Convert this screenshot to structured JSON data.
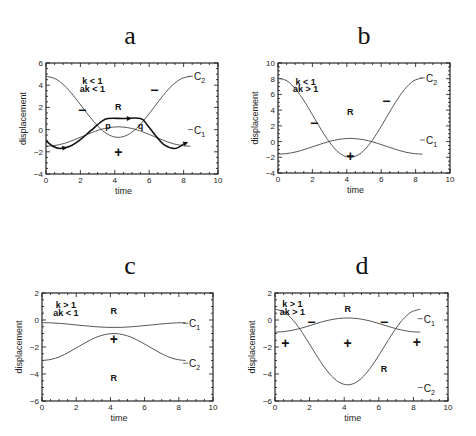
{
  "chart_data": [
    {
      "panel": "a",
      "type": "line",
      "title": "a",
      "xlabel": "time",
      "ylabel": "displacement",
      "xlim": [
        0,
        10
      ],
      "ylim": [
        -4,
        6
      ],
      "xticks": [
        0,
        2,
        4,
        6,
        8,
        10
      ],
      "yticks": [
        -4,
        -2,
        0,
        2,
        4,
        6
      ],
      "grid": false,
      "annotations": [
        {
          "text": "k < 1",
          "x": 2.7,
          "y": 4.4
        },
        {
          "text": "ak < 1",
          "x": 2.7,
          "y": 3.7
        },
        {
          "text": "R",
          "x": 4.2,
          "y": 2.0
        },
        {
          "text": "p",
          "x": 3.6,
          "y": 0.35
        },
        {
          "text": "q",
          "x": 5.5,
          "y": 0.35
        },
        {
          "text": "−",
          "x": 2.1,
          "y": 1.7
        },
        {
          "text": "−",
          "x": 6.3,
          "y": 3.5
        },
        {
          "text": "+",
          "x": 4.2,
          "y": -2.1
        }
      ],
      "series": [
        {
          "name": "C2",
          "label": "C₂",
          "style": "thin",
          "x": [
            0,
            0.525,
            1.05,
            1.575,
            2.1,
            2.625,
            3.15,
            3.675,
            4.2,
            4.725,
            5.25,
            5.775,
            6.3,
            6.825,
            7.35,
            7.875,
            8.4
          ],
          "values": [
            4.8,
            4.59,
            4.0,
            3.1,
            2.05,
            1.0,
            0.1,
            -0.49,
            -0.7,
            -0.49,
            0.1,
            1.0,
            2.05,
            3.1,
            4.0,
            4.59,
            4.8
          ]
        },
        {
          "name": "C1",
          "label": "C₁",
          "style": "thin",
          "x": [
            0,
            0.525,
            1.05,
            1.575,
            2.1,
            2.625,
            3.15,
            3.675,
            4.2,
            4.725,
            5.25,
            5.775,
            6.3,
            6.825,
            7.35,
            7.875,
            8.4
          ],
          "values": [
            -1.5,
            -1.43,
            -1.25,
            -0.96,
            -0.63,
            -0.29,
            -0.0,
            0.18,
            0.25,
            0.18,
            0.0,
            -0.29,
            -0.63,
            -0.96,
            -1.25,
            -1.43,
            -1.5
          ]
        },
        {
          "name": "trajectory",
          "label": "",
          "style": "thick-arrow",
          "x": [
            0,
            0.4,
            0.8,
            1.4,
            2.0,
            2.6,
            3.2,
            3.6,
            4.5,
            5.5,
            5.9,
            6.4,
            6.9,
            7.5,
            8.0
          ],
          "values": [
            -1.0,
            -1.5,
            -1.7,
            -1.5,
            -0.9,
            -0.1,
            0.7,
            1.0,
            1.0,
            1.0,
            0.4,
            -0.6,
            -1.4,
            -1.7,
            -1.3
          ]
        }
      ],
      "curve_labels": [
        {
          "text": "C₂",
          "x": 8.6,
          "y": 4.8
        },
        {
          "text": "C₁",
          "x": 8.6,
          "y": 0.0
        }
      ]
    },
    {
      "panel": "b",
      "type": "line",
      "title": "b",
      "xlabel": "time",
      "ylabel": "displacement",
      "xlim": [
        0,
        10
      ],
      "ylim": [
        -4,
        10
      ],
      "xticks": [
        0,
        2,
        4,
        6,
        8,
        10
      ],
      "yticks": [
        -4,
        -2,
        0,
        2,
        4,
        6,
        8,
        10
      ],
      "grid": false,
      "annotations": [
        {
          "text": "k < 1",
          "x": 1.6,
          "y": 7.6
        },
        {
          "text": "ak > 1",
          "x": 1.6,
          "y": 6.7
        },
        {
          "text": "R",
          "x": 4.2,
          "y": 3.8
        },
        {
          "text": "−",
          "x": 2.1,
          "y": 2.2
        },
        {
          "text": "−",
          "x": 6.3,
          "y": 5.0
        },
        {
          "text": "+",
          "x": 4.2,
          "y": -2.0
        }
      ],
      "series": [
        {
          "name": "C2",
          "label": "C₂",
          "style": "thin",
          "x": [
            0,
            0.525,
            1.05,
            1.575,
            2.1,
            2.625,
            3.15,
            3.675,
            4.2,
            4.725,
            5.25,
            5.775,
            6.3,
            6.825,
            7.35,
            7.875,
            8.4
          ],
          "values": [
            8.1,
            7.72,
            6.62,
            4.98,
            3.05,
            1.12,
            -0.52,
            -1.62,
            -2.0,
            -1.62,
            -0.52,
            1.12,
            3.05,
            4.98,
            6.62,
            7.72,
            8.1
          ]
        },
        {
          "name": "C1",
          "label": "C₁",
          "style": "thin",
          "x": [
            0,
            0.525,
            1.05,
            1.575,
            2.1,
            2.625,
            3.15,
            3.675,
            4.2,
            4.725,
            5.25,
            5.775,
            6.3,
            6.825,
            7.35,
            7.875,
            8.4
          ],
          "values": [
            -1.6,
            -1.52,
            -1.31,
            -0.98,
            -0.6,
            -0.22,
            0.11,
            0.32,
            0.4,
            0.32,
            0.11,
            -0.22,
            -0.6,
            -0.98,
            -1.31,
            -1.52,
            -1.6
          ]
        }
      ],
      "curve_labels": [
        {
          "text": "C₂",
          "x": 8.6,
          "y": 8.1
        },
        {
          "text": "C₁",
          "x": 8.6,
          "y": 0.2
        }
      ]
    },
    {
      "panel": "c",
      "type": "line",
      "title": "c",
      "xlabel": "time",
      "ylabel": "displacement",
      "xlim": [
        0,
        10
      ],
      "ylim": [
        -6,
        2
      ],
      "xticks": [
        0,
        2,
        4,
        6,
        8,
        10
      ],
      "yticks": [
        -6,
        -4,
        -2,
        0,
        2
      ],
      "grid": false,
      "annotations": [
        {
          "text": "k > 1",
          "x": 1.4,
          "y": 1.1
        },
        {
          "text": "ak < 1",
          "x": 1.4,
          "y": 0.5
        },
        {
          "text": "R",
          "x": 4.2,
          "y": 0.7
        },
        {
          "text": "+",
          "x": 4.2,
          "y": -1.5
        },
        {
          "text": "R",
          "x": 4.2,
          "y": -4.3
        }
      ],
      "series": [
        {
          "name": "C1",
          "label": "C₁",
          "style": "thin",
          "x": [
            0,
            0.525,
            1.05,
            1.575,
            2.1,
            2.625,
            3.15,
            3.675,
            4.2,
            4.725,
            5.25,
            5.775,
            6.3,
            6.825,
            7.35,
            7.875,
            8.4
          ],
          "values": [
            -0.2,
            -0.21,
            -0.25,
            -0.31,
            -0.38,
            -0.44,
            -0.5,
            -0.54,
            -0.55,
            -0.54,
            -0.5,
            -0.44,
            -0.38,
            -0.31,
            -0.25,
            -0.21,
            -0.2
          ]
        },
        {
          "name": "C2",
          "label": "C₂",
          "style": "thin",
          "x": [
            0,
            0.525,
            1.05,
            1.575,
            2.1,
            2.625,
            3.15,
            3.675,
            4.2,
            4.725,
            5.25,
            5.775,
            6.3,
            6.825,
            7.35,
            7.875,
            8.4
          ],
          "values": [
            -3.0,
            -2.92,
            -2.71,
            -2.38,
            -2.0,
            -1.62,
            -1.29,
            -1.08,
            -1.0,
            -1.08,
            -1.29,
            -1.62,
            -2.0,
            -2.38,
            -2.71,
            -2.92,
            -3.0
          ]
        }
      ],
      "curve_labels": [
        {
          "text": "C₁",
          "x": 8.6,
          "y": -0.25
        },
        {
          "text": "C₂",
          "x": 8.6,
          "y": -3.2
        }
      ]
    },
    {
      "panel": "d",
      "type": "line",
      "title": "d",
      "xlabel": "time",
      "ylabel": "displacement",
      "xlim": [
        0,
        10
      ],
      "ylim": [
        -6,
        2
      ],
      "xticks": [
        0,
        2,
        4,
        6,
        8,
        10
      ],
      "yticks": [
        -6,
        -4,
        -2,
        0,
        2
      ],
      "grid": false,
      "annotations": [
        {
          "text": "k > 1",
          "x": 1.0,
          "y": 1.2
        },
        {
          "text": "ak > 1",
          "x": 1.0,
          "y": 0.6
        },
        {
          "text": "R",
          "x": 4.2,
          "y": 0.8
        },
        {
          "text": "−",
          "x": 2.1,
          "y": -0.2
        },
        {
          "text": "−",
          "x": 6.3,
          "y": -0.2
        },
        {
          "text": "+",
          "x": 0.6,
          "y": -1.8
        },
        {
          "text": "+",
          "x": 4.2,
          "y": -1.8
        },
        {
          "text": "+",
          "x": 8.2,
          "y": -1.7
        },
        {
          "text": "R",
          "x": 6.3,
          "y": -3.6
        }
      ],
      "series": [
        {
          "name": "C1",
          "label": "C₁",
          "style": "thin",
          "x": [
            0,
            0.525,
            1.05,
            1.575,
            2.1,
            2.625,
            3.15,
            3.675,
            4.2,
            4.725,
            5.25,
            5.775,
            6.3,
            6.825,
            7.35,
            7.875,
            8.4
          ],
          "values": [
            -0.9,
            -0.86,
            -0.75,
            -0.58,
            -0.38,
            -0.17,
            0.0,
            0.11,
            0.15,
            0.11,
            0.0,
            -0.17,
            -0.38,
            -0.58,
            -0.75,
            -0.86,
            -0.9
          ]
        },
        {
          "name": "C2",
          "label": "C₂",
          "style": "thin",
          "x": [
            0,
            0.525,
            1.05,
            1.575,
            2.1,
            2.625,
            3.15,
            3.675,
            4.2,
            4.725,
            5.25,
            5.775,
            6.3,
            6.825,
            7.35,
            7.875,
            8.4
          ],
          "values": [
            0.8,
            0.59,
            -0.02,
            -0.93,
            -2.0,
            -3.07,
            -3.98,
            -4.59,
            -4.8,
            -4.59,
            -3.98,
            -3.07,
            -2.0,
            -0.93,
            -0.02,
            0.59,
            0.8
          ]
        }
      ],
      "curve_labels": [
        {
          "text": "C₁",
          "x": 8.6,
          "y": 0.1
        },
        {
          "text": "C₂",
          "x": 8.6,
          "y": -5.0
        }
      ]
    }
  ],
  "layout": {
    "panels": [
      {
        "id": "a",
        "title_x": 130,
        "title_y": 44,
        "plot": {
          "left": 46,
          "right": 218,
          "top": 63,
          "bottom": 174
        }
      },
      {
        "id": "b",
        "title_x": 364,
        "title_y": 44,
        "plot": {
          "left": 278,
          "right": 450,
          "top": 63,
          "bottom": 173
        }
      },
      {
        "id": "c",
        "title_x": 130,
        "title_y": 274,
        "plot": {
          "left": 42,
          "right": 213,
          "top": 293,
          "bottom": 401
        }
      },
      {
        "id": "d",
        "title_x": 362,
        "title_y": 274,
        "plot": {
          "left": 275,
          "right": 448,
          "top": 293,
          "bottom": 401
        }
      }
    ]
  }
}
